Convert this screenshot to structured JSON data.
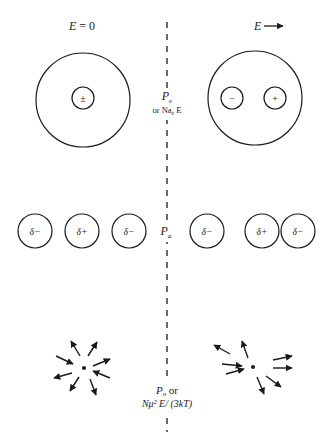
{
  "figure": {
    "left_header": "E = 0",
    "right_header": "E",
    "colors": {
      "ink": "#1a1a1a",
      "background": "#ffffff"
    },
    "divider": {
      "x": 167,
      "y1": 22,
      "y2": 432,
      "style": "dashed"
    },
    "rows": [
      {
        "name": "electronic-polarization",
        "label_main": "P",
        "label_sub": "e",
        "label_alt_prefix": "or Na",
        "label_alt_sub": "e",
        "label_alt_suffix": " E",
        "left": {
          "outer_circle": {
            "cx": 83,
            "cy": 100,
            "r": 47
          },
          "nucleus": {
            "cx": 83,
            "cy": 98,
            "r": 11,
            "symbol": "±"
          }
        },
        "right": {
          "outer_circle": {
            "cx": 255,
            "cy": 98,
            "r": 47
          },
          "charges": [
            {
              "cx": 232,
              "cy": 98,
              "r": 11,
              "symbol": "−"
            },
            {
              "cx": 275,
              "cy": 98,
              "r": 11,
              "symbol": "+"
            }
          ]
        }
      },
      {
        "name": "atomic-polarization",
        "label_main": "P",
        "label_sub": "a",
        "left_atoms": [
          {
            "cx": 35,
            "cy": 231,
            "r": 17,
            "symbol": "δ−"
          },
          {
            "cx": 82,
            "cy": 231,
            "r": 17,
            "symbol": "δ+"
          },
          {
            "cx": 129,
            "cy": 231,
            "r": 17,
            "symbol": "δ−"
          }
        ],
        "right_atoms": [
          {
            "cx": 207,
            "cy": 231,
            "r": 17,
            "symbol": "δ−"
          },
          {
            "cx": 262,
            "cy": 231,
            "r": 17,
            "symbol": "δ+"
          },
          {
            "cx": 298,
            "cy": 231,
            "r": 17,
            "symbol": "δ−"
          }
        ]
      },
      {
        "name": "orientation-polarization",
        "label_main": "P",
        "label_sub": "o",
        "label_or": "or",
        "label_formula": "Nμ² E/ (3kT)",
        "left_center": {
          "x": 84,
          "y": 368
        },
        "right_center": {
          "x": 253,
          "y": 367
        },
        "left_arrows": [
          {
            "x1": 80,
            "y1": 356,
            "x2": 71,
            "y2": 341
          },
          {
            "x1": 88,
            "y1": 356,
            "x2": 97,
            "y2": 342
          },
          {
            "x1": 56,
            "y1": 356,
            "x2": 73,
            "y2": 364
          },
          {
            "x1": 93,
            "y1": 366,
            "x2": 110,
            "y2": 359
          },
          {
            "x1": 72,
            "y1": 373,
            "x2": 54,
            "y2": 378
          },
          {
            "x1": 110,
            "y1": 378,
            "x2": 93,
            "y2": 371
          },
          {
            "x1": 79,
            "y1": 377,
            "x2": 70,
            "y2": 391
          },
          {
            "x1": 90,
            "y1": 379,
            "x2": 96,
            "y2": 395
          }
        ],
        "right_arrows": [
          {
            "x1": 230,
            "y1": 354,
            "x2": 214,
            "y2": 345
          },
          {
            "x1": 248,
            "y1": 358,
            "x2": 242,
            "y2": 341
          },
          {
            "x1": 222,
            "y1": 364,
            "x2": 242,
            "y2": 366
          },
          {
            "x1": 226,
            "y1": 374,
            "x2": 244,
            "y2": 369
          },
          {
            "x1": 273,
            "y1": 360,
            "x2": 292,
            "y2": 356
          },
          {
            "x1": 273,
            "y1": 368,
            "x2": 292,
            "y2": 368
          },
          {
            "x1": 266,
            "y1": 376,
            "x2": 281,
            "y2": 387
          },
          {
            "x1": 257,
            "y1": 377,
            "x2": 264,
            "y2": 394
          }
        ]
      }
    ]
  }
}
